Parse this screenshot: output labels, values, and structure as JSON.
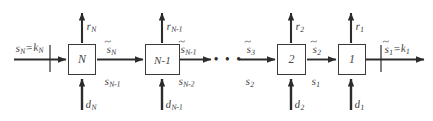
{
  "figure": {
    "type": "block-diagram",
    "background_color": "#ffffff",
    "line_color": "#2c2c2c",
    "box_border_color": "#3a3a3a",
    "text_color": "#3a3a3a"
  },
  "stages": [
    {
      "id": "stage-N",
      "box_label": "N",
      "top_output_label": {
        "base": "r",
        "sub": "N"
      },
      "bottom_input_label": {
        "base": "d",
        "sub": "N"
      },
      "left_input_top": {
        "base": "s",
        "sub": "N",
        "tilde": false,
        "equals": "k",
        "equals_sub": "N"
      },
      "right_output_top": {
        "base": "s",
        "sub": "N",
        "tilde": true
      },
      "right_output_bottom": {
        "base": "s",
        "sub": "N-1",
        "tilde": false
      }
    },
    {
      "id": "stage-N-1",
      "box_label": "N-1",
      "top_output_label": {
        "base": "r",
        "sub": "N-1"
      },
      "bottom_input_label": {
        "base": "d",
        "sub": "N-1"
      },
      "right_output_top": {
        "base": "s",
        "sub": "N-1",
        "tilde": true
      },
      "right_output_bottom": {
        "base": "s",
        "sub": "N-2",
        "tilde": false
      }
    },
    {
      "id": "stage-2",
      "box_label": "2",
      "top_output_label": {
        "base": "r",
        "sub": "2"
      },
      "bottom_input_label": {
        "base": "d",
        "sub": "2"
      },
      "left_input_top": {
        "base": "s",
        "sub": "3",
        "tilde": true
      },
      "left_input_bottom": {
        "base": "s",
        "sub": "2",
        "tilde": false
      },
      "right_output_top": {
        "base": "s",
        "sub": "2",
        "tilde": true
      },
      "right_output_bottom": {
        "base": "s",
        "sub": "1",
        "tilde": false
      }
    },
    {
      "id": "stage-1",
      "box_label": "1",
      "top_output_label": {
        "base": "r",
        "sub": "1"
      },
      "bottom_input_label": {
        "base": "d",
        "sub": "1"
      },
      "right_output_top": {
        "base": "s",
        "sub": "1",
        "tilde": true,
        "equals": "k",
        "equals_sub": "1"
      }
    }
  ],
  "labels": {
    "box_N": "N",
    "box_N_minus_1": "N-1",
    "box_2": "2",
    "box_1": "1",
    "ellipsis": "• • •",
    "r_N": "r",
    "r_N_sub": "N",
    "r_Nm1": "r",
    "r_Nm1_sub": "N-1",
    "r_2": "r",
    "r_2_sub": "2",
    "r_1": "r",
    "r_1_sub": "1",
    "d_N": "d",
    "d_N_sub": "N",
    "d_Nm1": "d",
    "d_Nm1_sub": "N-1",
    "d_2": "d",
    "d_2_sub": "2",
    "d_1": "d",
    "d_1_sub": "1",
    "s_N": "s",
    "s_N_sub": "N",
    "eq": "=",
    "k_N": "k",
    "k_N_sub": "N",
    "st_N": "s",
    "st_N_sub": "N",
    "s_Nm1": "s",
    "s_Nm1_sub": "N-1",
    "st_Nm1": "s",
    "st_Nm1_sub": "N-1",
    "s_Nm2": "s",
    "s_Nm2_sub": "N-2",
    "st_3": "s",
    "st_3_sub": "3",
    "s_2": "s",
    "s_2_sub": "2",
    "st_2": "s",
    "st_2_sub": "2",
    "s_1": "s",
    "s_1_sub": "1",
    "st_1": "s",
    "st_1_sub": "1",
    "k_1": "k",
    "k_1_sub": "1"
  }
}
